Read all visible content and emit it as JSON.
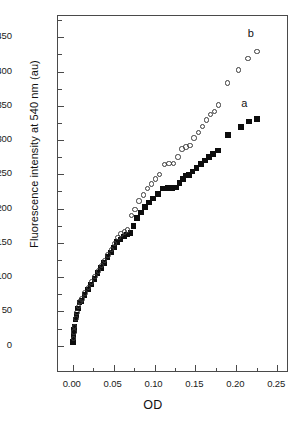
{
  "chart_data": {
    "type": "scatter",
    "title": "",
    "xlabel": "OD",
    "ylabel": "Fluorescence intensity at 540 nm (au)",
    "xlim": [
      -0.018,
      0.262
    ],
    "ylim": [
      -37,
      481
    ],
    "xticks": [
      0.0,
      0.05,
      0.1,
      0.15,
      0.2,
      0.25
    ],
    "xticklabels": [
      "0.00",
      "0.05",
      "0.10",
      "0.15",
      "0.20",
      "0.25"
    ],
    "xminorticks": [
      0.025,
      0.075,
      0.125,
      0.175,
      0.225
    ],
    "yticks": [
      0,
      50,
      100,
      150,
      200,
      250,
      300,
      350,
      400,
      450
    ],
    "yticklabels": [
      "0",
      "50",
      "100",
      "150",
      "200",
      "250",
      "300",
      "350",
      "400",
      "450"
    ],
    "yminorticks": [
      25,
      75,
      125,
      175,
      225,
      275,
      325,
      375,
      425,
      475
    ],
    "grid": false,
    "legend": "inline-annotations",
    "annotations": [
      {
        "text": "a",
        "x": 0.206,
        "y": 352
      },
      {
        "text": "b",
        "x": 0.214,
        "y": 455
      }
    ],
    "series": [
      {
        "name": "a",
        "label": "a",
        "marker": "filled-square",
        "color": "#0d0d0d",
        "points": [
          [
            0.0005,
            5
          ],
          [
            0.0008,
            9
          ],
          [
            0.0012,
            14
          ],
          [
            0.0018,
            23
          ],
          [
            0.0022,
            27
          ],
          [
            0.0035,
            38
          ],
          [
            0.0045,
            45
          ],
          [
            0.0062,
            54
          ],
          [
            0.0085,
            63
          ],
          [
            0.0105,
            65
          ],
          [
            0.0145,
            74
          ],
          [
            0.0185,
            82
          ],
          [
            0.0225,
            89
          ],
          [
            0.0265,
            97
          ],
          [
            0.0305,
            106
          ],
          [
            0.0345,
            113
          ],
          [
            0.0385,
            121
          ],
          [
            0.0425,
            129
          ],
          [
            0.0465,
            136
          ],
          [
            0.0505,
            143
          ],
          [
            0.0545,
            151
          ],
          [
            0.0585,
            155
          ],
          [
            0.0625,
            159
          ],
          [
            0.0665,
            162
          ],
          [
            0.0705,
            164
          ],
          [
            0.0745,
            175
          ],
          [
            0.0785,
            186
          ],
          [
            0.0835,
            194
          ],
          [
            0.0885,
            202
          ],
          [
            0.0935,
            209
          ],
          [
            0.0985,
            215
          ],
          [
            0.1045,
            221
          ],
          [
            0.1105,
            229
          ],
          [
            0.1165,
            230
          ],
          [
            0.1215,
            230
          ],
          [
            0.1265,
            231
          ],
          [
            0.1305,
            237
          ],
          [
            0.1345,
            243
          ],
          [
            0.1385,
            248
          ],
          [
            0.1425,
            249
          ],
          [
            0.1465,
            254
          ],
          [
            0.1515,
            259
          ],
          [
            0.1565,
            265
          ],
          [
            0.1615,
            270
          ],
          [
            0.1665,
            275
          ],
          [
            0.1715,
            280
          ],
          [
            0.1775,
            285
          ],
          [
            0.1895,
            307
          ],
          [
            0.2055,
            319
          ],
          [
            0.2155,
            327
          ],
          [
            0.2255,
            331
          ]
        ]
      },
      {
        "name": "b",
        "label": "b",
        "marker": "open-circle",
        "color": "#3a3a3a",
        "points": [
          [
            0.0008,
            10
          ],
          [
            0.0016,
            20
          ],
          [
            0.0024,
            28
          ],
          [
            0.0038,
            40
          ],
          [
            0.005,
            48
          ],
          [
            0.0068,
            57
          ],
          [
            0.009,
            64
          ],
          [
            0.0112,
            68
          ],
          [
            0.0152,
            77
          ],
          [
            0.0192,
            85
          ],
          [
            0.0232,
            93
          ],
          [
            0.0272,
            101
          ],
          [
            0.0312,
            109
          ],
          [
            0.0352,
            117
          ],
          [
            0.0392,
            124
          ],
          [
            0.0432,
            132
          ],
          [
            0.0472,
            140
          ],
          [
            0.0512,
            149
          ],
          [
            0.0552,
            158
          ],
          [
            0.0592,
            163
          ],
          [
            0.0632,
            166
          ],
          [
            0.0672,
            169
          ],
          [
            0.0718,
            190
          ],
          [
            0.0762,
            199
          ],
          [
            0.0812,
            211
          ],
          [
            0.0862,
            220
          ],
          [
            0.0912,
            229
          ],
          [
            0.0962,
            236
          ],
          [
            0.1012,
            243
          ],
          [
            0.1062,
            250
          ],
          [
            0.1125,
            264
          ],
          [
            0.1175,
            266
          ],
          [
            0.1235,
            266
          ],
          [
            0.1285,
            275
          ],
          [
            0.1335,
            287
          ],
          [
            0.1385,
            290
          ],
          [
            0.1435,
            292
          ],
          [
            0.1485,
            303
          ],
          [
            0.1535,
            311
          ],
          [
            0.1585,
            320
          ],
          [
            0.1635,
            329
          ],
          [
            0.1685,
            337
          ],
          [
            0.1735,
            342
          ],
          [
            0.1785,
            351
          ],
          [
            0.1895,
            383
          ],
          [
            0.2025,
            402
          ],
          [
            0.2145,
            419
          ],
          [
            0.2255,
            429
          ]
        ]
      }
    ]
  }
}
